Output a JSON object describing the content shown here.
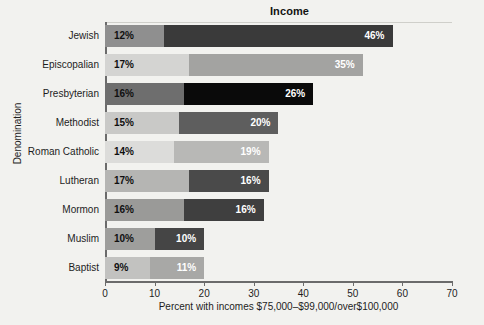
{
  "chart_data": {
    "type": "bar",
    "orientation": "horizontal",
    "stacked": true,
    "title": "Income",
    "xlabel": "Percent with incomes $75,000–$99,000/over$100,000",
    "ylabel": "Denomination",
    "xlim": [
      0,
      70
    ],
    "xticks": [
      0,
      10,
      20,
      30,
      40,
      50,
      60,
      70
    ],
    "grid": false,
    "legend": "none",
    "categories": [
      "Jewish",
      "Episcopalian",
      "Presbyterian",
      "Methodist",
      "Roman Catholic",
      "Lutheran",
      "Mormon",
      "Muslim",
      "Baptist"
    ],
    "series": [
      {
        "name": "$75,000–$99,000",
        "values": [
          12,
          17,
          16,
          15,
          14,
          17,
          16,
          10,
          9
        ],
        "labels": [
          "12%",
          "17%",
          "16%",
          "15%",
          "14%",
          "17%",
          "16%",
          "10%",
          "9%"
        ]
      },
      {
        "name": "over $100,000",
        "values": [
          46,
          35,
          26,
          20,
          19,
          16,
          16,
          10,
          11
        ],
        "labels": [
          "46%",
          "35%",
          "26%",
          "20%",
          "19%",
          "16%",
          "16%",
          "10%",
          "11%"
        ]
      }
    ],
    "totals": [
      58,
      52,
      42,
      35,
      33,
      33,
      32,
      20,
      20
    ],
    "bar_colors": {
      "segment1": [
        "#8f8f8f",
        "#d4d4d2",
        "#6e6e6e",
        "#c9c9c7",
        "#dcdcda",
        "#b5b5b3",
        "#9a9a98",
        "#9e9e9c",
        "#c2c2c0"
      ],
      "segment2": [
        "#3a3a3a",
        "#a3a3a1",
        "#0a0a0a",
        "#5e5e5e",
        "#b8b8b6",
        "#4a4a4a",
        "#3f3f3f",
        "#454545",
        "#a8a8a6"
      ]
    },
    "label_colors": {
      "segment1": [
        "#101010",
        "#101010",
        "#101010",
        "#101010",
        "#101010",
        "#101010",
        "#101010",
        "#101010",
        "#101010"
      ],
      "segment2": [
        "#ffffff",
        "#ffffff",
        "#ffffff",
        "#ffffff",
        "#ffffff",
        "#ffffff",
        "#ffffff",
        "#ffffff",
        "#ffffff"
      ]
    },
    "axis_color": "#6b6b6b",
    "background": "#f2f2ef"
  }
}
